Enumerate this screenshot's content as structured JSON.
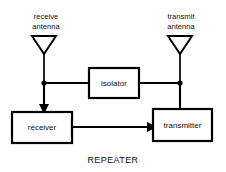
{
  "diagram": {
    "title": "REPEATER",
    "type": "block-diagram",
    "antennas": [
      {
        "id": "receive-antenna",
        "label_line1": "receive",
        "label_line2": "antenna",
        "x": 44,
        "label_x": 46,
        "label_y1": 16,
        "label_y2": 26,
        "tri_top_y": 36,
        "tri_tip_y": 54,
        "tri_half_width": 12,
        "stem_bottom_y": 88
      },
      {
        "id": "transmit-antenna",
        "label_line1": "transmit",
        "label_line2": "antenna",
        "x": 180,
        "label_x": 181,
        "label_y1": 16,
        "label_y2": 26,
        "tri_top_y": 36,
        "tri_tip_y": 54,
        "tri_half_width": 12,
        "stem_bottom_y": 88
      }
    ],
    "blocks": [
      {
        "id": "isolator",
        "label": "isolator",
        "x": 89,
        "y": 68,
        "width": 50,
        "height": 30
      },
      {
        "id": "receiver",
        "label": "receiver",
        "x": 12,
        "y": 112,
        "width": 60,
        "height": 31
      },
      {
        "id": "transmitter",
        "label": "transmitter",
        "x": 153,
        "y": 109,
        "width": 59,
        "height": 32
      }
    ],
    "connections": [
      {
        "id": "receive-antenna-to-isolator",
        "from": "receive-antenna",
        "to": "isolator",
        "arrow": false
      },
      {
        "id": "isolator-to-transmit-antenna",
        "from": "isolator",
        "to": "transmit-antenna",
        "arrow": false
      },
      {
        "id": "receive-antenna-to-receiver",
        "from": "receive-antenna",
        "to": "receiver",
        "arrow": true
      },
      {
        "id": "receiver-to-transmitter",
        "from": "receiver",
        "to": "transmitter",
        "arrow": true
      },
      {
        "id": "transmitter-to-transmit-antenna",
        "from": "transmitter",
        "to": "transmit-antenna",
        "arrow": false
      }
    ],
    "junctions": [
      {
        "id": "junction-receive-bus",
        "x": 44,
        "y": 83
      },
      {
        "id": "junction-transmit-bus",
        "x": 180,
        "y": 83
      }
    ],
    "caption": {
      "text": "REPEATER",
      "x": 113,
      "y": 161
    },
    "colors": {
      "background": "#ffffff",
      "stroke": "#000000",
      "text": "#111111"
    }
  }
}
